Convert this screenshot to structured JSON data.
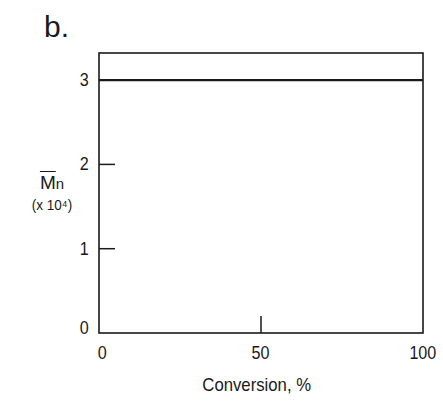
{
  "panel_label": "b.",
  "chart_data": {
    "type": "line",
    "title": "",
    "xlabel": "Conversion, %",
    "ylabel": "M̄n (x 10⁴)",
    "ylabel_main": "M",
    "ylabel_sub": "n",
    "ylabel_scale": "(x 10⁴)",
    "xlim": [
      0,
      100
    ],
    "ylim": [
      0,
      3.3
    ],
    "x_ticks": [
      0,
      50,
      100
    ],
    "x_tick_labels": [
      "0",
      "50",
      "100"
    ],
    "y_ticks": [
      0,
      1,
      2,
      3
    ],
    "y_tick_labels": [
      "0",
      "1",
      "2",
      "3"
    ],
    "grid": false,
    "legend": null,
    "series": [
      {
        "name": "Mn",
        "x": [
          0,
          100
        ],
        "values": [
          3,
          3
        ]
      }
    ]
  }
}
